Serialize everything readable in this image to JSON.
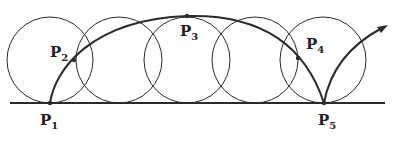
{
  "diagram": {
    "colors": {
      "stroke": "#2a2a2a",
      "background": "#ffffff"
    },
    "baseline": {
      "x1": 10,
      "x2": 385,
      "y": 103
    },
    "circles": [
      {
        "cx": 50,
        "cy": 60,
        "r": 43
      },
      {
        "cx": 119,
        "cy": 60,
        "r": 43
      },
      {
        "cx": 187,
        "cy": 60,
        "r": 43
      },
      {
        "cx": 255,
        "cy": 60,
        "r": 43
      },
      {
        "cx": 323,
        "cy": 60,
        "r": 43
      }
    ],
    "points": [
      {
        "id": "P1",
        "label": "P",
        "sub": "1",
        "x": 50,
        "y": 103,
        "lx": 40,
        "ly": 113
      },
      {
        "id": "P2",
        "label": "P",
        "sub": "2",
        "x": 74,
        "y": 60,
        "lx": 50,
        "ly": 45
      },
      {
        "id": "P3",
        "label": "P",
        "sub": "3",
        "x": 187,
        "y": 16,
        "lx": 180,
        "ly": 24
      },
      {
        "id": "P4",
        "label": "P",
        "sub": "4",
        "x": 298,
        "y": 58,
        "lx": 306,
        "ly": 37
      },
      {
        "id": "P5",
        "label": "P",
        "sub": "5",
        "x": 324,
        "y": 103,
        "lx": 318,
        "ly": 113
      }
    ]
  }
}
